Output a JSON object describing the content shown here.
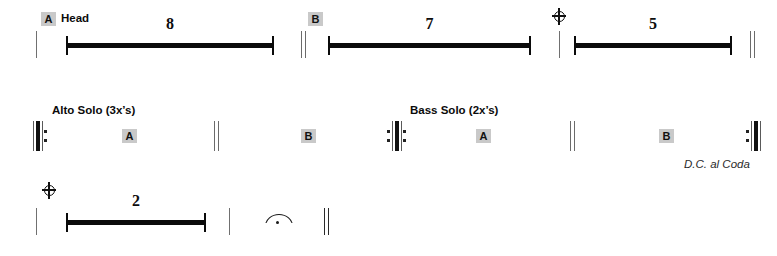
{
  "document": {
    "type": "lead-sheet-road-map",
    "title": "Jazz chart road map"
  },
  "systems": [
    {
      "id": "system-1",
      "labels": [
        {
          "name": "head-label",
          "text": "Head"
        }
      ],
      "rehearsal_marks": [
        {
          "name": "rehearsal-mark-a",
          "letter": "A"
        },
        {
          "name": "rehearsal-mark-b",
          "letter": "B"
        }
      ],
      "multirests": [
        {
          "name": "multirest-8",
          "count": "8"
        },
        {
          "name": "multirest-7",
          "count": "7"
        },
        {
          "name": "multirest-5",
          "count": "5"
        }
      ],
      "symbols": [
        {
          "name": "coda-symbol",
          "glyph": "coda"
        },
        {
          "name": "final-double-barline",
          "glyph": "double-barline"
        }
      ]
    },
    {
      "id": "system-2",
      "labels": [
        {
          "name": "alto-solo-label",
          "text": "Alto Solo (3x’s)"
        },
        {
          "name": "bass-solo-label",
          "text": "Bass Solo (2x’s)"
        }
      ],
      "rehearsal_marks": [
        {
          "name": "rehearsal-mark-a-alto",
          "letter": "A"
        },
        {
          "name": "rehearsal-mark-b-alto",
          "letter": "B"
        },
        {
          "name": "rehearsal-mark-a-bass",
          "letter": "A"
        },
        {
          "name": "rehearsal-mark-b-bass",
          "letter": "B"
        }
      ],
      "navigation": [
        {
          "name": "dc-al-coda-text",
          "text": "D.C. al Coda"
        }
      ],
      "symbols": [
        {
          "name": "repeat-start-barline",
          "glyph": "repeat-start"
        },
        {
          "name": "repeat-both-barline",
          "glyph": "repeat-both"
        },
        {
          "name": "repeat-end-barline",
          "glyph": "repeat-end"
        }
      ]
    },
    {
      "id": "system-3",
      "multirests": [
        {
          "name": "multirest-2",
          "count": "2"
        }
      ],
      "symbols": [
        {
          "name": "coda-symbol-section",
          "glyph": "coda"
        },
        {
          "name": "fermata-symbol",
          "glyph": "fermata"
        },
        {
          "name": "final-double-barline-end",
          "glyph": "double-barline"
        }
      ]
    }
  ],
  "colors": {
    "ink": "#0b0b0b",
    "rehearsal_box": "#c9c9c9",
    "barline_gray": "#6b6b6b"
  }
}
